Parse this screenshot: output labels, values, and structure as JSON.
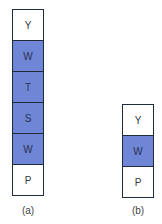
{
  "colors": {
    "filled": "#6f86d6",
    "empty": "#ffffff",
    "border": "#1f2a3a"
  },
  "diagrams": [
    {
      "caption": "(a)",
      "cells": [
        {
          "label": "Y",
          "filled": false
        },
        {
          "label": "W",
          "filled": true
        },
        {
          "label": "T",
          "filled": true
        },
        {
          "label": "S",
          "filled": true
        },
        {
          "label": "W",
          "filled": true
        },
        {
          "label": "P",
          "filled": false
        }
      ]
    },
    {
      "caption": "(b)",
      "cells": [
        {
          "label": "Y",
          "filled": false
        },
        {
          "label": "W",
          "filled": true
        },
        {
          "label": "P",
          "filled": false
        }
      ]
    }
  ]
}
